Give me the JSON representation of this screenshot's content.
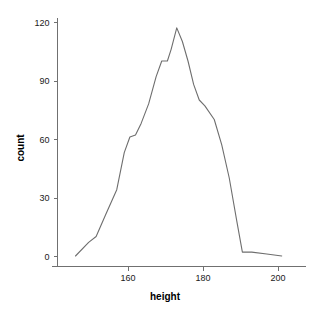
{
  "chart_data": {
    "type": "line",
    "title": "",
    "subtitle": "",
    "xlabel": "height",
    "ylabel": "count",
    "xlim": [
      144.5,
      203.0
    ],
    "ylim": [
      -2,
      124
    ],
    "xticks": [
      160,
      180,
      200
    ],
    "xticklabels": [
      "160",
      "180",
      "200"
    ],
    "yticks": [
      0,
      30,
      60,
      90,
      120
    ],
    "yticklabels": [
      "0",
      "30",
      "60",
      "90",
      "120"
    ],
    "grid": false,
    "legend": null,
    "legend_position": "none",
    "annotations": [],
    "series": [
      {
        "name": "count",
        "color": "#6e6e6e",
        "x": [
          146.0,
          149.5,
          151.5,
          154.0,
          157.0,
          159.0,
          160.5,
          162.0,
          163.5,
          165.5,
          167.5,
          169.0,
          170.5,
          171.5,
          173.0,
          174.5,
          176.0,
          177.5,
          179.0,
          180.5,
          183.0,
          185.0,
          187.0,
          189.0,
          190.5,
          193.0,
          197.0,
          201.0
        ],
        "y": [
          0,
          7,
          10,
          21,
          34,
          53,
          61,
          62,
          68,
          78,
          92,
          100,
          100,
          106,
          117,
          110,
          100,
          88,
          80,
          77,
          70,
          57,
          40,
          18,
          2,
          2,
          1,
          0
        ]
      }
    ]
  },
  "axis": {
    "x_title": "height",
    "y_title": "count"
  }
}
